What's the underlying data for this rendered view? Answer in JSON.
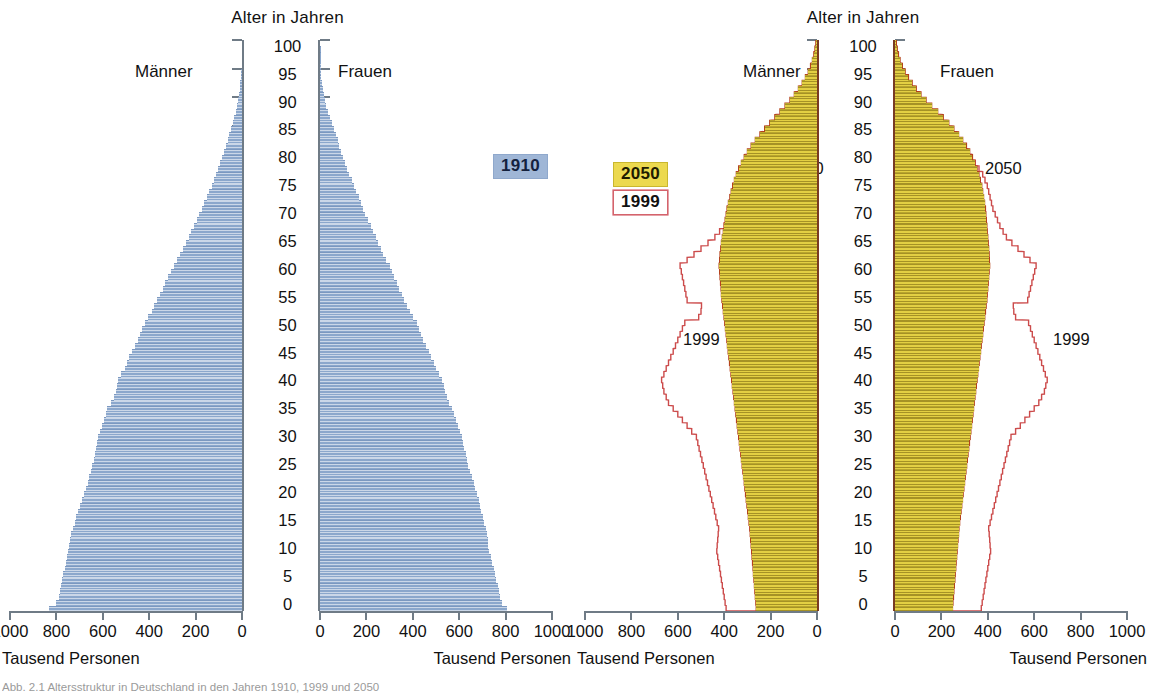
{
  "figure": {
    "caption": "Abb. 2.1  Altersstruktur in Deutschland in den Jahren 1910, 1999 und 2050",
    "unit_label": "Tausend Personen",
    "axis_title": "Alter in Jahren",
    "male_label": "Männer",
    "female_label": "Frauen",
    "colors": {
      "bar_1910": "#8ba7cc",
      "bar_2050": "#e3cf43",
      "outline_1999": "#cc4b4b",
      "outline_2050": "#b5431c",
      "badge_1910_bg": "#9fb6d6",
      "badge_2050_bg": "#ecd94f",
      "badge_1999_border": "#d4636c",
      "axis": "#6f7b86"
    }
  },
  "panel_left": {
    "name": "1910",
    "badge": "1910",
    "title": "Alter in Jahren",
    "male_label": "Männer",
    "female_label": "Frauen",
    "unit_left": "Tausend Personen",
    "unit_right": "Tausend Personen"
  },
  "panel_right": {
    "name": "2050 / 1999",
    "badge_fill": "2050",
    "badge_outline": "1999",
    "title": "Alter in Jahren",
    "male_label": "Männer",
    "female_label": "Frauen",
    "unit_left": "Tausend Personen",
    "unit_right": "Tausend Personen",
    "annot_2050_left": "2050",
    "annot_2050_right": "2050",
    "annot_1999_left": "1999",
    "annot_1999_right": "1999"
  },
  "axes": {
    "y_ticks": [
      100,
      95,
      90,
      85,
      80,
      75,
      70,
      65,
      60,
      55,
      50,
      45,
      40,
      35,
      30,
      25,
      20,
      15,
      10,
      5,
      0
    ],
    "y_range": [
      0,
      100
    ],
    "x_ticks_left": [
      1000,
      800,
      600,
      400,
      200,
      0
    ],
    "x_ticks_right": [
      0,
      200,
      400,
      600,
      800,
      1000
    ],
    "x_range": [
      0,
      1000
    ],
    "x_unit": "Tausend Personen"
  },
  "chart_data": {
    "type": "bar",
    "subtitle": "Bevölkerungspyramiden, Männer links / Frauen rechts",
    "xlabel": "Tausend Personen",
    "ylabel": "Alter in Jahren",
    "xlim": [
      0,
      1000
    ],
    "ylim": [
      0,
      100
    ],
    "grid": false,
    "legend_position": "left-of-right-panel",
    "legend": [
      {
        "label": "1910",
        "style": "filled",
        "color": "#8ba7cc"
      },
      {
        "label": "2050",
        "style": "filled",
        "color": "#e3cf43"
      },
      {
        "label": "1999",
        "style": "outline",
        "color": "#cc4b4b"
      }
    ],
    "ages": [
      0,
      1,
      2,
      3,
      4,
      5,
      6,
      7,
      8,
      9,
      10,
      11,
      12,
      13,
      14,
      15,
      16,
      17,
      18,
      19,
      20,
      21,
      22,
      23,
      24,
      25,
      26,
      27,
      28,
      29,
      30,
      31,
      32,
      33,
      34,
      35,
      36,
      37,
      38,
      39,
      40,
      41,
      42,
      43,
      44,
      45,
      46,
      47,
      48,
      49,
      50,
      51,
      52,
      53,
      54,
      55,
      56,
      57,
      58,
      59,
      60,
      61,
      62,
      63,
      64,
      65,
      66,
      67,
      68,
      69,
      70,
      71,
      72,
      73,
      74,
      75,
      76,
      77,
      78,
      79,
      80,
      81,
      82,
      83,
      84,
      85,
      86,
      87,
      88,
      89,
      90,
      91,
      92,
      93,
      94,
      95,
      96,
      97,
      98,
      99,
      100
    ],
    "series": [
      {
        "name": "1910 Männer",
        "panel": "left",
        "side": "male",
        "color": "#8ba7cc",
        "values": [
          830,
          800,
          790,
          785,
          780,
          775,
          770,
          765,
          760,
          755,
          750,
          745,
          740,
          735,
          730,
          722,
          714,
          706,
          698,
          690,
          682,
          674,
          666,
          658,
          650,
          645,
          640,
          635,
          630,
          625,
          620,
          612,
          604,
          596,
          588,
          580,
          565,
          550,
          545,
          540,
          535,
          520,
          505,
          495,
          485,
          475,
          462,
          450,
          440,
          430,
          420,
          405,
          390,
          378,
          366,
          354,
          342,
          330,
          318,
          306,
          295,
          280,
          266,
          254,
          242,
          230,
          218,
          206,
          195,
          184,
          173,
          162,
          151,
          141,
          131,
          121,
          112,
          103,
          94,
          86,
          78,
          70,
          62,
          55,
          48,
          41,
          34,
          28,
          22,
          17,
          13,
          10,
          7,
          5,
          3,
          2,
          1.2,
          0.8,
          0.5,
          0.3,
          0.1
        ]
      },
      {
        "name": "1910 Frauen",
        "panel": "left",
        "side": "female",
        "color": "#8ba7cc",
        "values": [
          805,
          785,
          778,
          772,
          766,
          760,
          754,
          748,
          742,
          736,
          730,
          726,
          722,
          718,
          714,
          708,
          702,
          696,
          690,
          684,
          678,
          670,
          662,
          654,
          646,
          640,
          634,
          628,
          622,
          616,
          610,
          602,
          594,
          586,
          578,
          570,
          558,
          546,
          540,
          534,
          528,
          514,
          500,
          490,
          480,
          470,
          458,
          446,
          436,
          426,
          416,
          402,
          388,
          376,
          364,
          352,
          340,
          330,
          320,
          310,
          300,
          286,
          273,
          262,
          251,
          240,
          229,
          218,
          207,
          196,
          186,
          176,
          166,
          156,
          146,
          136,
          127,
          118,
          109,
          100,
          92,
          84,
          76,
          68,
          60,
          52,
          44,
          36,
          28,
          21,
          16,
          12,
          9,
          6,
          4,
          2.5,
          1.5,
          1,
          0.6,
          0.3,
          0.1
        ]
      },
      {
        "name": "2050 Männer",
        "panel": "right",
        "side": "male",
        "color": "#e3cf43",
        "values": [
          262,
          264,
          266,
          268,
          270,
          272,
          274,
          276,
          278,
          280,
          282,
          284,
          286,
          288,
          290,
          293,
          296,
          299,
          302,
          305,
          308,
          311,
          314,
          317,
          320,
          323,
          326,
          329,
          332,
          335,
          338,
          341,
          344,
          347,
          350,
          353,
          356,
          359,
          362,
          365,
          368,
          371,
          374,
          377,
          380,
          383,
          386,
          389,
          392,
          395,
          398,
          401,
          404,
          407,
          410,
          412,
          414,
          416,
          418,
          420,
          422,
          420,
          418,
          415,
          412,
          408,
          404,
          400,
          396,
          392,
          388,
          382,
          376,
          370,
          364,
          356,
          348,
          338,
          326,
          314,
          300,
          284,
          266,
          246,
          226,
          204,
          182,
          160,
          138,
          117,
          98,
          80,
          64,
          50,
          38,
          28,
          20,
          14,
          9,
          5,
          2
        ]
      },
      {
        "name": "2050 Frauen",
        "panel": "right",
        "side": "female",
        "color": "#e3cf43",
        "values": [
          248,
          250,
          252,
          254,
          256,
          258,
          260,
          262,
          264,
          266,
          268,
          270,
          272,
          274,
          276,
          279,
          282,
          285,
          288,
          291,
          294,
          297,
          300,
          303,
          306,
          309,
          312,
          315,
          318,
          321,
          324,
          327,
          330,
          333,
          336,
          339,
          342,
          345,
          348,
          351,
          354,
          357,
          360,
          363,
          366,
          369,
          372,
          375,
          378,
          381,
          384,
          387,
          390,
          393,
          396,
          398,
          400,
          402,
          404,
          406,
          408,
          407,
          406,
          404,
          402,
          400,
          398,
          396,
          394,
          392,
          390,
          386,
          382,
          378,
          374,
          368,
          362,
          354,
          344,
          334,
          322,
          308,
          292,
          274,
          254,
          232,
          208,
          184,
          158,
          134,
          112,
          92,
          74,
          58,
          44,
          32,
          22,
          15,
          10,
          6,
          2
        ]
      },
      {
        "name": "1999 Männer",
        "panel": "right",
        "side": "male",
        "style": "outline",
        "color": "#cc4b4b",
        "values": [
          392,
          396,
          400,
          404,
          408,
          412,
          416,
          420,
          424,
          428,
          432,
          430,
          428,
          426,
          424,
          430,
          436,
          442,
          448,
          454,
          460,
          466,
          472,
          478,
          484,
          490,
          496,
          502,
          508,
          514,
          520,
          540,
          560,
          580,
          600,
          620,
          640,
          650,
          660,
          665,
          670,
          660,
          650,
          640,
          630,
          620,
          610,
          600,
          590,
          580,
          570,
          510,
          500,
          498,
          560,
          565,
          570,
          575,
          580,
          585,
          590,
          560,
          530,
          500,
          470,
          440,
          420,
          400,
          385,
          370,
          355,
          345,
          335,
          325,
          315,
          300,
          285,
          265,
          245,
          225,
          205,
          175,
          150,
          125,
          105,
          88,
          72,
          58,
          45,
          34,
          26,
          19,
          14,
          10,
          7,
          4,
          2.5,
          1.5,
          1,
          0.5,
          0.2
        ]
      },
      {
        "name": "1999 Frauen",
        "panel": "right",
        "side": "female",
        "style": "outline",
        "color": "#cc4b4b",
        "values": [
          372,
          376,
          380,
          384,
          388,
          392,
          396,
          400,
          404,
          408,
          412,
          410,
          408,
          406,
          404,
          410,
          416,
          422,
          428,
          434,
          440,
          446,
          452,
          458,
          464,
          470,
          476,
          482,
          488,
          494,
          500,
          520,
          540,
          560,
          580,
          600,
          620,
          632,
          644,
          650,
          656,
          648,
          640,
          632,
          624,
          616,
          608,
          600,
          592,
          584,
          576,
          520,
          512,
          510,
          572,
          578,
          584,
          590,
          596,
          602,
          608,
          582,
          556,
          530,
          504,
          480,
          466,
          452,
          442,
          432,
          422,
          416,
          410,
          404,
          398,
          388,
          378,
          362,
          346,
          330,
          314,
          288,
          262,
          234,
          206,
          180,
          155,
          130,
          108,
          88,
          70,
          55,
          42,
          32,
          23,
          16,
          11,
          7,
          4,
          2,
          1
        ]
      }
    ]
  }
}
